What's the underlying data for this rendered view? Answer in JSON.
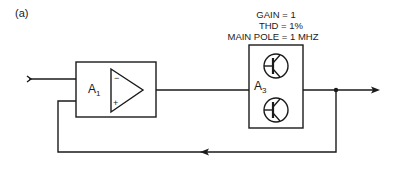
{
  "figure": {
    "label": "(a)"
  },
  "annotations": {
    "gain": "GAIN = 1",
    "thd": "THD = 1%",
    "main_pole": "MAIN POLE = 1 MHZ"
  },
  "blocks": [
    {
      "id": "A1",
      "label": "A",
      "subscript": "1",
      "type": "op-amp",
      "inputs": {
        "inverting": "−",
        "non_inverting": "+"
      }
    },
    {
      "id": "A3",
      "label": "A",
      "subscript": "3",
      "type": "transistor-buffer",
      "transistor_count": 2
    }
  ],
  "signals": {
    "input": "input-arrow",
    "output": "output-arrow",
    "feedback": "feedback-loop-from-output-to-A1"
  },
  "colors": {
    "stroke": "#1a1a1a",
    "background": "#ffffff"
  }
}
